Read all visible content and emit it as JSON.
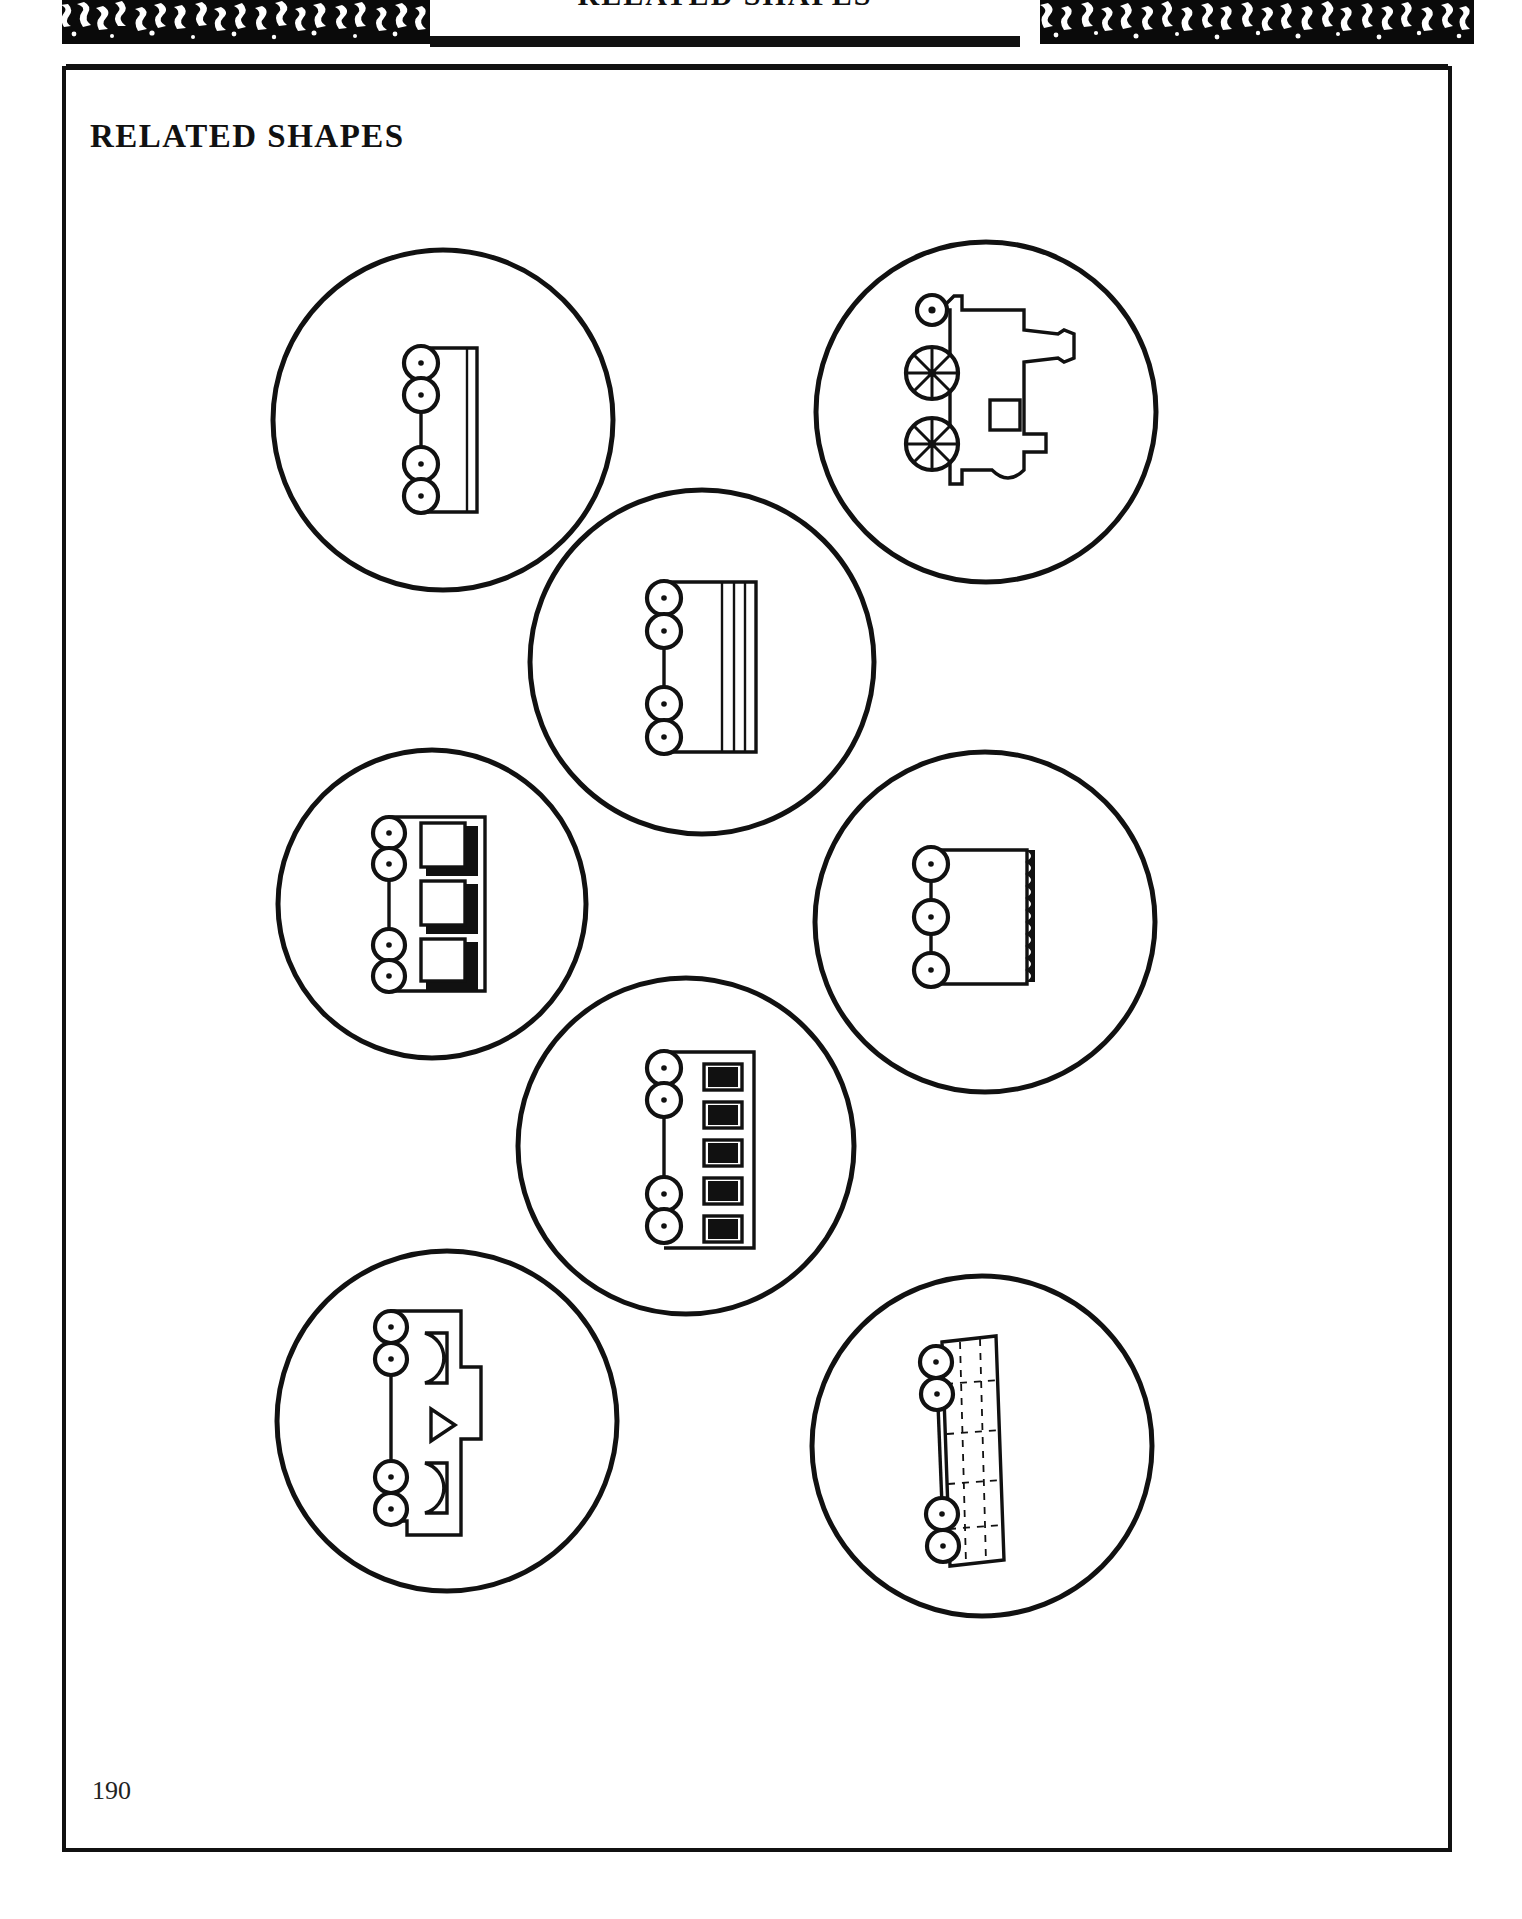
{
  "header": {
    "band_title": "RELATED SHAPES",
    "noise_pattern_name": "marbled-noise-texture"
  },
  "page": {
    "section_title": "RELATED SHAPES",
    "page_number": "190",
    "frame_color": "#111111",
    "background_color": "#ffffff",
    "ink_color": "#111111"
  },
  "figures": [
    {
      "id": "fig-1",
      "name": "flatcar-plain",
      "position": "top-left",
      "cx": 375,
      "cy": 348,
      "r": 172,
      "caption": "",
      "wheels": 4,
      "body_style": "plain-deck-two-rails",
      "panels": 0
    },
    {
      "id": "fig-2",
      "name": "steam-locomotive",
      "position": "top-right",
      "cx": 918,
      "cy": 340,
      "r": 172,
      "caption": "",
      "wheels": 3,
      "body_style": "locomotive-boiler-with-spoked-wheels",
      "panels": 1
    },
    {
      "id": "fig-3",
      "name": "flatcar-triple-rail",
      "position": "middle-center-upper",
      "cx": 636,
      "cy": 592,
      "r": 176,
      "caption": "",
      "wheels": 4,
      "body_style": "deck-with-three-longitudinal-rails",
      "panels": 3
    },
    {
      "id": "fig-4",
      "name": "boxcar-three-openings",
      "position": "middle-left",
      "cx": 366,
      "cy": 834,
      "r": 157,
      "caption": "",
      "wheels": 4,
      "body_style": "body-with-three-shadowed-openings",
      "panels": 3
    },
    {
      "id": "fig-5",
      "name": "hopper-ribbed-edge",
      "position": "middle-right",
      "cx": 919,
      "cy": 852,
      "r": 172,
      "caption": "",
      "wheels": 3,
      "body_style": "body-with-ribbed-serrated-edge",
      "panels": 0
    },
    {
      "id": "fig-6",
      "name": "coach-five-windows",
      "position": "bottom-center-upper",
      "cx": 620,
      "cy": 1076,
      "r": 170,
      "caption": "",
      "wheels": 4,
      "body_style": "body-with-five-black-windows",
      "panels": 5
    },
    {
      "id": "fig-7",
      "name": "wagon-arched-openings",
      "position": "bottom-left",
      "cx": 366,
      "cy": 1337,
      "r": 172,
      "caption": "",
      "wheels": 4,
      "body_style": "body-with-arched-and-triangular-openings",
      "panels": 3
    },
    {
      "id": "fig-8",
      "name": "flatcar-stake-deck",
      "position": "bottom-right",
      "cx": 916,
      "cy": 1362,
      "r": 172,
      "caption": "",
      "wheels": 4,
      "body_style": "deck-with-dashed-stake-pockets",
      "panels": 0
    }
  ]
}
